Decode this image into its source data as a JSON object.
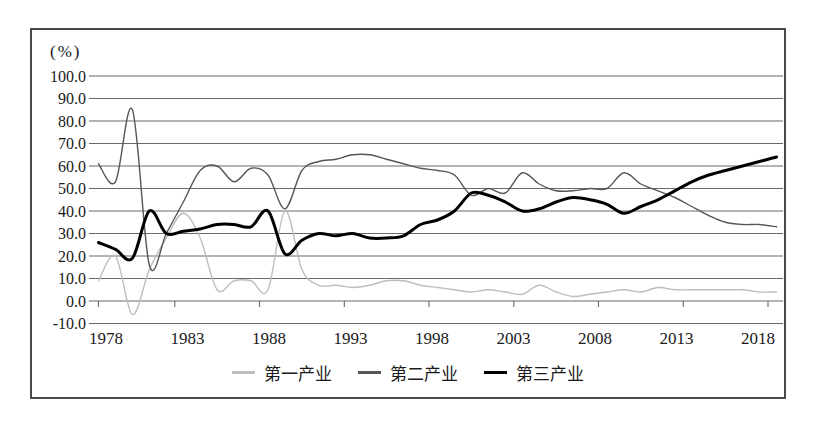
{
  "figure": {
    "unit_label": "(%)"
  },
  "colors": {
    "frame": "#4a4a4a",
    "grid": "#6a6a6a",
    "text": "#1a1a1a",
    "primary_series": "#bdbdbd",
    "secondary_series": "#565656",
    "tertiary_series": "#000000"
  },
  "legend": {
    "items": [
      {
        "label": "第一产业"
      },
      {
        "label": "第二产业"
      },
      {
        "label": "第三产业"
      }
    ]
  },
  "chart_data": {
    "type": "line",
    "smoothed": true,
    "grid": true,
    "legend_position": "bottom",
    "ylabel_unit": "(%)",
    "ylim": [
      -10,
      100
    ],
    "y_tick_step": 10,
    "y_ticks": [
      "100.0",
      "90.0",
      "80.0",
      "70.0",
      "60.0",
      "50.0",
      "40.0",
      "30.0",
      "20.0",
      "10.0",
      "0.0",
      "-10.0"
    ],
    "x_ticks": [
      "1978",
      "1983",
      "1988",
      "1993",
      "1998",
      "2003",
      "2008",
      "2013",
      "2018"
    ],
    "x": [
      1978,
      1979,
      1980,
      1981,
      1982,
      1983,
      1984,
      1985,
      1986,
      1987,
      1988,
      1989,
      1990,
      1991,
      1992,
      1993,
      1994,
      1995,
      1996,
      1997,
      1998,
      1999,
      2000,
      2001,
      2002,
      2003,
      2004,
      2005,
      2006,
      2007,
      2008,
      2009,
      2010,
      2011,
      2012,
      2013,
      2014,
      2015,
      2016,
      2017,
      2018
    ],
    "series": [
      {
        "name": "第一产业",
        "color": "#bdbdbd",
        "width": 1.4,
        "values": [
          9,
          20,
          -6,
          14,
          28,
          39,
          28,
          5,
          9,
          9,
          5,
          40,
          14,
          7,
          7,
          6,
          7,
          9,
          9,
          7,
          6,
          5,
          4,
          5,
          4,
          3,
          7,
          4,
          2,
          3,
          4,
          5,
          4,
          6,
          5,
          5,
          5,
          5,
          5,
          4,
          4
        ]
      },
      {
        "name": "第二产业",
        "color": "#565656",
        "width": 1.4,
        "values": [
          61,
          53,
          85,
          16,
          30,
          44,
          58,
          60,
          53,
          59,
          56,
          41,
          58,
          62,
          63,
          65,
          65,
          63,
          61,
          59,
          58,
          56,
          47,
          50,
          48,
          57,
          52,
          49,
          49,
          50,
          50,
          57,
          52,
          49,
          46,
          42,
          38,
          35,
          34,
          34,
          33
        ]
      },
      {
        "name": "第三产业",
        "color": "#000000",
        "width": 3,
        "values": [
          26,
          23,
          19,
          40,
          30,
          31,
          32,
          34,
          34,
          33,
          40,
          21,
          27,
          30,
          29,
          30,
          28,
          28,
          29,
          34,
          36,
          40,
          48,
          47,
          44,
          40,
          41,
          44,
          46,
          45,
          43,
          39,
          42,
          45,
          49,
          53,
          56,
          58,
          60,
          62,
          64
        ]
      }
    ]
  }
}
